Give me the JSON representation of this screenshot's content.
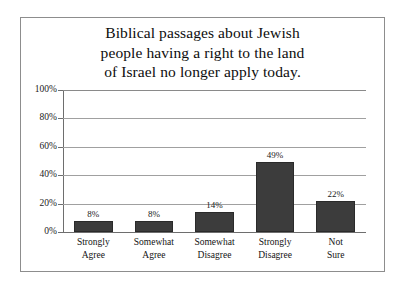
{
  "chart_data": {
    "type": "bar",
    "title": "Biblical passages about Jewish people having a right to the land of Israel no longer apply today.",
    "title_lines": [
      "Biblical passages about Jewish",
      "people having a right to the land",
      "of Israel no longer apply today."
    ],
    "categories": [
      "Strongly Agree",
      "Somewhat Agree",
      "Somewhat Disagree",
      "Strongly Disagree",
      "Not Sure"
    ],
    "category_lines": [
      [
        "Strongly",
        "Agree"
      ],
      [
        "Somewhat",
        "Agree"
      ],
      [
        "Somewhat",
        "Disagree"
      ],
      [
        "Strongly",
        "Disagree"
      ],
      [
        "Not",
        "Sure"
      ]
    ],
    "values": [
      8,
      8,
      14,
      49,
      22
    ],
    "value_labels": [
      "8%",
      "8%",
      "14%",
      "49%",
      "22%"
    ],
    "xlabel": "",
    "ylabel": "",
    "ylim": [
      0,
      100
    ],
    "yticks": [
      0,
      20,
      40,
      60,
      80,
      100
    ],
    "ytick_labels": [
      "0%",
      "20%",
      "40%",
      "60%",
      "80%",
      "100%"
    ],
    "grid": true,
    "legend": false,
    "colors": {
      "bar_fill": "#3c3c3c",
      "bar_stroke": "#2a2a2a",
      "gridline": "#a0a0a0",
      "axis": "#6e6e6e",
      "frame": "#8d8d8d",
      "text": "#131313",
      "background": "#ffffff"
    }
  }
}
